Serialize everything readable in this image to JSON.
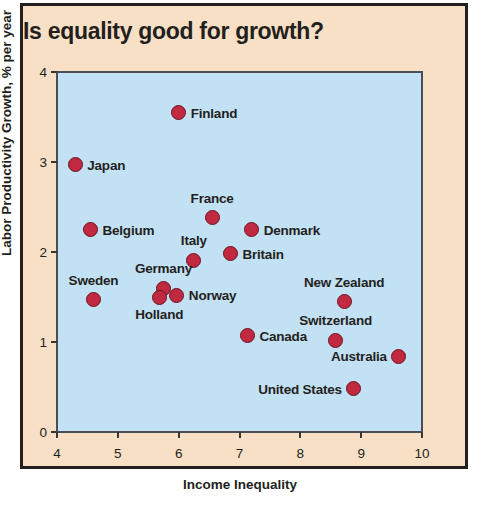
{
  "chart_data": {
    "type": "scatter",
    "title": "Is equality good for growth?",
    "xlabel": "Income Inequality",
    "ylabel": "Labor Productivity Growth, % per year",
    "xlim": [
      4,
      10
    ],
    "ylim": [
      0,
      4
    ],
    "xticks": [
      "4",
      "5",
      "6",
      "7",
      "8",
      "9",
      "10"
    ],
    "yticks": [
      "0",
      "1",
      "2",
      "3",
      "4"
    ],
    "grid": false,
    "legend": "none",
    "marker_color": "#c0293f",
    "marker_edge_color": "#6d1420",
    "plot_background": "#c3e1f4",
    "panel_background": "#f8e0c6",
    "points": [
      {
        "label": "Finland",
        "x": 6.0,
        "y": 3.55,
        "label_pos": "right"
      },
      {
        "label": "Japan",
        "x": 4.3,
        "y": 2.97,
        "label_pos": "right"
      },
      {
        "label": "France",
        "x": 6.55,
        "y": 2.38,
        "label_pos": "above"
      },
      {
        "label": "Belgium",
        "x": 4.55,
        "y": 2.25,
        "label_pos": "right"
      },
      {
        "label": "Denmark",
        "x": 7.2,
        "y": 2.25,
        "label_pos": "right"
      },
      {
        "label": "Italy",
        "x": 6.25,
        "y": 1.91,
        "label_pos": "above"
      },
      {
        "label": "Britain",
        "x": 6.85,
        "y": 1.98,
        "label_pos": "right"
      },
      {
        "label": "Germany",
        "x": 5.75,
        "y": 1.6,
        "label_pos": "above"
      },
      {
        "label": "Holland",
        "x": 5.68,
        "y": 1.5,
        "label_pos": "below"
      },
      {
        "label": "Norway",
        "x": 5.97,
        "y": 1.52,
        "label_pos": "right"
      },
      {
        "label": "Sweden",
        "x": 4.6,
        "y": 1.47,
        "label_pos": "above"
      },
      {
        "label": "New Zealand",
        "x": 8.72,
        "y": 1.45,
        "label_pos": "above"
      },
      {
        "label": "Canada",
        "x": 7.13,
        "y": 1.07,
        "label_pos": "right"
      },
      {
        "label": "Switzerland",
        "x": 8.58,
        "y": 1.02,
        "label_pos": "above"
      },
      {
        "label": "Australia",
        "x": 9.62,
        "y": 0.84,
        "label_pos": "left"
      },
      {
        "label": "United States",
        "x": 8.88,
        "y": 0.48,
        "label_pos": "left"
      }
    ]
  }
}
